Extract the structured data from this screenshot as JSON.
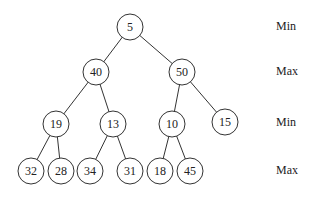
{
  "diagram": {
    "type": "min-max-heap",
    "nodes": [
      {
        "id": "n5",
        "value": "5",
        "x": 130,
        "y": 27
      },
      {
        "id": "n40",
        "value": "40",
        "x": 96,
        "y": 72
      },
      {
        "id": "n50",
        "value": "50",
        "x": 182,
        "y": 72
      },
      {
        "id": "n19",
        "value": "19",
        "x": 56,
        "y": 124
      },
      {
        "id": "n13",
        "value": "13",
        "x": 113,
        "y": 124
      },
      {
        "id": "n10",
        "value": "10",
        "x": 172,
        "y": 124
      },
      {
        "id": "n15",
        "value": "15",
        "x": 225,
        "y": 122
      },
      {
        "id": "n32",
        "value": "32",
        "x": 31,
        "y": 171
      },
      {
        "id": "n28",
        "value": "28",
        "x": 61,
        "y": 171
      },
      {
        "id": "n34",
        "value": "34",
        "x": 90,
        "y": 171
      },
      {
        "id": "n31",
        "value": "31",
        "x": 130,
        "y": 171
      },
      {
        "id": "n18",
        "value": "18",
        "x": 160,
        "y": 171
      },
      {
        "id": "n45",
        "value": "45",
        "x": 190,
        "y": 171
      }
    ],
    "edges": [
      [
        "n5",
        "n40"
      ],
      [
        "n5",
        "n50"
      ],
      [
        "n40",
        "n19"
      ],
      [
        "n40",
        "n13"
      ],
      [
        "n50",
        "n10"
      ],
      [
        "n50",
        "n15"
      ],
      [
        "n19",
        "n32"
      ],
      [
        "n19",
        "n28"
      ],
      [
        "n13",
        "n34"
      ],
      [
        "n13",
        "n31"
      ],
      [
        "n10",
        "n18"
      ],
      [
        "n10",
        "n45"
      ]
    ],
    "level_labels": [
      {
        "text": "Min",
        "y": 27
      },
      {
        "text": "Max",
        "y": 72
      },
      {
        "text": "Min",
        "y": 123
      },
      {
        "text": "Max",
        "y": 171
      }
    ]
  }
}
